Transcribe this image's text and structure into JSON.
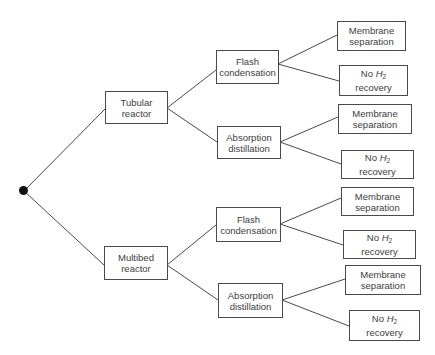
{
  "diagram": {
    "type": "decision-tree",
    "root": {
      "label": ""
    },
    "level1": [
      {
        "id": "tubular",
        "line1": "Tubular",
        "line2": "reactor"
      },
      {
        "id": "multibed",
        "line1": "Multibed",
        "line2": "reactor"
      }
    ],
    "level2": [
      {
        "id": "flash1",
        "parent": "tubular",
        "line1": "Flash",
        "line2": "condensation"
      },
      {
        "id": "absorb1",
        "parent": "tubular",
        "line1": "Absorption",
        "line2": "distillation"
      },
      {
        "id": "flash2",
        "parent": "multibed",
        "line1": "Flash",
        "line2": "condensation"
      },
      {
        "id": "absorb2",
        "parent": "multibed",
        "line1": "Absorption",
        "line2": "distillation"
      }
    ],
    "level3": [
      {
        "id": "mem1",
        "parent": "flash1",
        "line1": "Membrane",
        "line2": "separation"
      },
      {
        "id": "noh1",
        "parent": "flash1",
        "prefix": "No ",
        "h": "H",
        "sub": "2",
        "line2": "recovery"
      },
      {
        "id": "mem2",
        "parent": "absorb1",
        "line1": "Membrane",
        "line2": "separation"
      },
      {
        "id": "noh2",
        "parent": "absorb1",
        "prefix": "No ",
        "h": "H",
        "sub": "2",
        "line2": "recovery"
      },
      {
        "id": "mem3",
        "parent": "flash2",
        "line1": "Membrane",
        "line2": "separation"
      },
      {
        "id": "noh3",
        "parent": "flash2",
        "prefix": "No ",
        "h": "H",
        "sub": "2",
        "line2": "recovery"
      },
      {
        "id": "mem4",
        "parent": "absorb2",
        "line1": "Membrane",
        "line2": "separation"
      },
      {
        "id": "noh4",
        "parent": "absorb2",
        "prefix": "No ",
        "h": "H",
        "sub": "2",
        "line2": "recovery"
      }
    ],
    "colors": {
      "line": "#4a4a4a",
      "root": "#111111",
      "text": "#3d3d3d"
    }
  }
}
